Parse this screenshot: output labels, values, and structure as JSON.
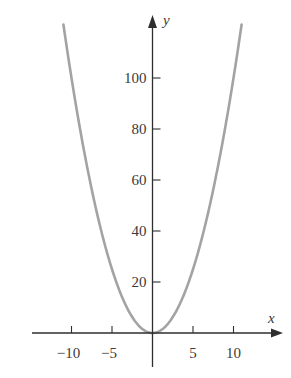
{
  "chart_data": {
    "type": "line",
    "title": "",
    "function": "y = x^2",
    "xlabel": "x",
    "ylabel": "y",
    "xlim": [
      -14.8,
      16
    ],
    "ylim": [
      -13,
      124
    ],
    "x_ticks": [
      -10,
      -5,
      5,
      10
    ],
    "x_tick_labels": [
      "−10",
      "−5",
      "5",
      "10"
    ],
    "y_ticks": [
      20,
      40,
      60,
      80,
      100
    ],
    "y_tick_labels": [
      "20",
      "40",
      "60",
      "80",
      "100"
    ],
    "grid": false,
    "legend": null,
    "series": [
      {
        "name": "y = x^2",
        "x_range": [
          -11,
          11
        ],
        "x": [
          -11,
          -10,
          -8,
          -6,
          -4,
          -2,
          0,
          2,
          4,
          6,
          8,
          10,
          11
        ],
        "values": [
          121,
          100,
          64,
          36,
          16,
          4,
          0,
          4,
          16,
          36,
          64,
          100,
          121
        ],
        "color": "#a3a3a3"
      }
    ],
    "axis_color": "#2e2e2e"
  },
  "labels": {
    "x_axis": "x",
    "y_axis": "y",
    "x_ticks": [
      "−10",
      "−5",
      "5",
      "10"
    ],
    "y_ticks": [
      "20",
      "40",
      "60",
      "80",
      "100"
    ]
  }
}
